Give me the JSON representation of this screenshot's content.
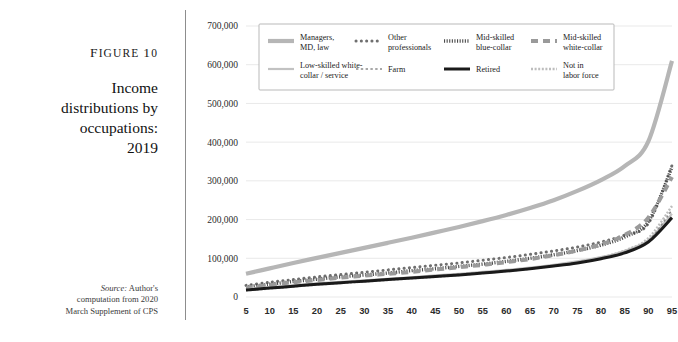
{
  "figure": {
    "number_label": "Figure 10",
    "title_lines": [
      "Income",
      "distributions by",
      "occupations:",
      "2019"
    ],
    "source_prefix": "Source:",
    "source_lines": [
      " Author's",
      "computation from 2020",
      "March Supplement of CPS"
    ]
  },
  "chart_data": {
    "type": "line",
    "xlabel": "",
    "ylabel": "",
    "xlim": [
      5,
      95
    ],
    "ylim": [
      0,
      700000
    ],
    "grid": true,
    "legend_position": "top-inside",
    "x": [
      5,
      10,
      15,
      20,
      25,
      30,
      35,
      40,
      45,
      50,
      55,
      60,
      65,
      70,
      75,
      80,
      85,
      90,
      95
    ],
    "xtick_labels": [
      "5",
      "10",
      "15",
      "20",
      "25",
      "30",
      "35",
      "40",
      "45",
      "50",
      "55",
      "60",
      "65",
      "70",
      "75",
      "80",
      "85",
      "90",
      "95"
    ],
    "ytick_values": [
      0,
      100000,
      200000,
      300000,
      400000,
      500000,
      600000,
      700000
    ],
    "ytick_labels": [
      "0",
      "100,000",
      "200,000",
      "300,000",
      "400,000",
      "500,000",
      "600,000",
      "700,000"
    ],
    "series": [
      {
        "name": "Managers, MD, law",
        "style": "thick-solid-gray",
        "color": "#b6b6b6",
        "values": [
          60000,
          74000,
          88000,
          101000,
          114000,
          127000,
          140000,
          153000,
          167000,
          181000,
          196000,
          212000,
          230000,
          250000,
          274000,
          302000,
          338000,
          402000,
          610000
        ]
      },
      {
        "name": "Other professionals",
        "style": "dotted",
        "color": "#6f6f6f",
        "values": [
          30000,
          38000,
          45000,
          52000,
          58000,
          64000,
          70000,
          76000,
          82000,
          88000,
          95000,
          102000,
          110000,
          119000,
          129000,
          142000,
          160000,
          190000,
          340000
        ]
      },
      {
        "name": "Mid-skilled blue-collar",
        "style": "fine-hatch",
        "color": "#4a4a4a",
        "values": [
          26000,
          33000,
          40000,
          46000,
          52000,
          57000,
          62000,
          68000,
          73000,
          79000,
          85000,
          92000,
          100000,
          109000,
          120000,
          134000,
          155000,
          195000,
          335000
        ]
      },
      {
        "name": "Mid-skilled white-collar",
        "style": "dashed",
        "color": "#9a9a9a",
        "values": [
          24000,
          31000,
          38000,
          44000,
          50000,
          55000,
          60000,
          65000,
          71000,
          77000,
          83000,
          90000,
          98000,
          108000,
          120000,
          136000,
          160000,
          205000,
          310000
        ]
      },
      {
        "name": "Low-skilled white-collar / service",
        "style": "thin-solid-gray",
        "color": "#c2c2c2",
        "values": [
          20000,
          25000,
          30000,
          35000,
          39000,
          43000,
          47000,
          51000,
          56000,
          60000,
          65000,
          70000,
          76000,
          83000,
          92000,
          103000,
          119000,
          147000,
          215000
        ]
      },
      {
        "name": "Farm",
        "style": "open-circles",
        "color": "#8c8c8c",
        "values": [
          19000,
          24000,
          29000,
          34000,
          38000,
          42000,
          46000,
          50000,
          54000,
          59000,
          63000,
          68000,
          74000,
          81000,
          90000,
          101000,
          117000,
          145000,
          225000
        ]
      },
      {
        "name": "Retired",
        "style": "thick-solid-black",
        "color": "#1a1a1a",
        "values": [
          18000,
          23000,
          28000,
          33000,
          37000,
          41000,
          45000,
          49000,
          53000,
          57000,
          62000,
          67000,
          73000,
          80000,
          88000,
          99000,
          114000,
          142000,
          205000
        ]
      },
      {
        "name": "Not in labor force",
        "style": "light-zigzag",
        "color": "#bdbdbd",
        "values": [
          17000,
          22000,
          27000,
          32000,
          36000,
          40000,
          44000,
          48000,
          52000,
          57000,
          62000,
          67000,
          73000,
          81000,
          90000,
          102000,
          120000,
          152000,
          235000
        ]
      }
    ]
  }
}
